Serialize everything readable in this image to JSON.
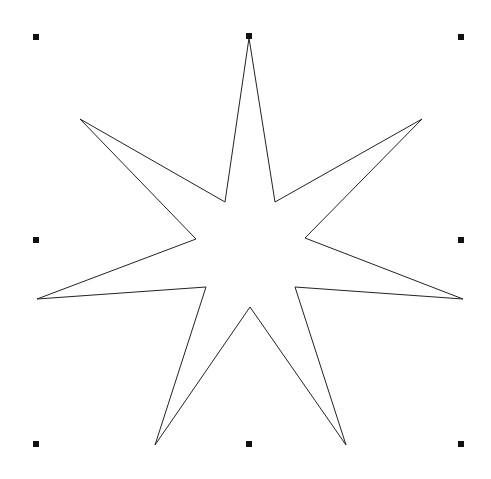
{
  "canvas": {
    "width": 491,
    "height": 479,
    "background": "#ffffff"
  },
  "shape": {
    "type": "seven-point-star",
    "stroke": "#222222",
    "stroke_width": 1,
    "fill": "none",
    "points": [
      [
        249,
        38
      ],
      [
        275,
        202
      ],
      [
        422,
        119
      ],
      [
        305,
        238
      ],
      [
        463,
        299
      ],
      [
        295,
        287
      ],
      [
        346,
        445
      ],
      [
        250,
        307
      ],
      [
        155,
        445
      ],
      [
        206,
        287
      ],
      [
        37,
        299
      ],
      [
        196,
        239
      ],
      [
        80,
        119
      ],
      [
        225,
        202
      ]
    ]
  },
  "selection": {
    "handle_color": "#111111",
    "handles": [
      {
        "name": "top-left",
        "x": 36,
        "y": 37
      },
      {
        "name": "top-center",
        "x": 249,
        "y": 36
      },
      {
        "name": "top-right",
        "x": 461,
        "y": 37
      },
      {
        "name": "middle-left",
        "x": 36,
        "y": 240
      },
      {
        "name": "middle-right",
        "x": 461,
        "y": 240
      },
      {
        "name": "bottom-left",
        "x": 36,
        "y": 444
      },
      {
        "name": "bottom-center",
        "x": 249,
        "y": 444
      },
      {
        "name": "bottom-right",
        "x": 461,
        "y": 444
      }
    ]
  }
}
